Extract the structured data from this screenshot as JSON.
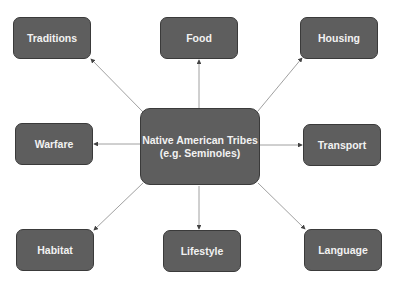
{
  "diagram": {
    "center": {
      "line1": "Native American Tribes",
      "line2": "(e.g. Seminoles)"
    },
    "nodes": [
      {
        "id": "traditions",
        "label": "Traditions"
      },
      {
        "id": "food",
        "label": "Food"
      },
      {
        "id": "housing",
        "label": "Housing"
      },
      {
        "id": "warfare",
        "label": "Warfare"
      },
      {
        "id": "transport",
        "label": "Transport"
      },
      {
        "id": "habitat",
        "label": "Habitat"
      },
      {
        "id": "lifestyle",
        "label": "Lifestyle"
      },
      {
        "id": "language",
        "label": "Language"
      }
    ],
    "colors": {
      "node_fill": "#5e5e5e",
      "node_border": "#3a3a3a",
      "text": "#f2f2f2",
      "edge": "#777777"
    }
  }
}
